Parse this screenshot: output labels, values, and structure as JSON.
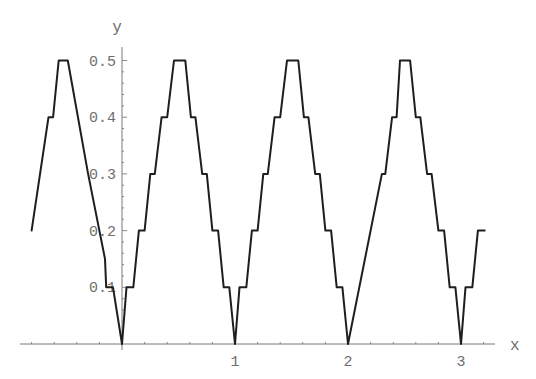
{
  "chart_data": {
    "type": "line",
    "title": "",
    "xlabel": "x",
    "ylabel": "y",
    "xlim": [
      -0.9,
      3.3
    ],
    "ylim": [
      0,
      0.52
    ],
    "grid": false,
    "legend": null,
    "x_ticks": [
      {
        "value": 1,
        "label": "1"
      },
      {
        "value": 2,
        "label": "2"
      },
      {
        "value": 3,
        "label": "3"
      }
    ],
    "x_minor_step": 0.2,
    "y_ticks": [
      {
        "value": 0.1,
        "label": "0.1"
      },
      {
        "value": 0.2,
        "label": "0.2"
      },
      {
        "value": 0.3,
        "label": "0.3"
      },
      {
        "value": 0.4,
        "label": "0.4"
      },
      {
        "value": 0.5,
        "label": "0.5"
      }
    ],
    "y_minor_step": 0.02,
    "series": [
      {
        "name": "y(x)",
        "color": "#1e1e1e",
        "points": [
          [
            -0.8,
            0.2
          ],
          [
            -0.65,
            0.4
          ],
          [
            -0.61,
            0.4
          ],
          [
            -0.56,
            0.5
          ],
          [
            -0.48,
            0.5
          ],
          [
            -0.3,
            0.3
          ],
          [
            -0.15,
            0.15
          ],
          [
            -0.14,
            0.1
          ],
          [
            -0.08,
            0.1
          ],
          [
            0.0,
            0.0
          ],
          [
            0.04,
            0.1
          ],
          [
            0.1,
            0.1
          ],
          [
            0.15,
            0.2
          ],
          [
            0.2,
            0.2
          ],
          [
            0.25,
            0.3
          ],
          [
            0.29,
            0.3
          ],
          [
            0.35,
            0.4
          ],
          [
            0.4,
            0.4
          ],
          [
            0.46,
            0.5
          ],
          [
            0.56,
            0.5
          ],
          [
            0.61,
            0.4
          ],
          [
            0.65,
            0.4
          ],
          [
            0.71,
            0.3
          ],
          [
            0.75,
            0.3
          ],
          [
            0.8,
            0.2
          ],
          [
            0.85,
            0.2
          ],
          [
            0.9,
            0.1
          ],
          [
            0.95,
            0.1
          ],
          [
            1.0,
            0.0
          ],
          [
            1.04,
            0.1
          ],
          [
            1.1,
            0.1
          ],
          [
            1.15,
            0.2
          ],
          [
            1.2,
            0.2
          ],
          [
            1.25,
            0.3
          ],
          [
            1.29,
            0.3
          ],
          [
            1.35,
            0.4
          ],
          [
            1.4,
            0.4
          ],
          [
            1.46,
            0.5
          ],
          [
            1.56,
            0.5
          ],
          [
            1.61,
            0.4
          ],
          [
            1.65,
            0.4
          ],
          [
            1.71,
            0.3
          ],
          [
            1.75,
            0.3
          ],
          [
            1.8,
            0.2
          ],
          [
            1.85,
            0.2
          ],
          [
            1.9,
            0.1
          ],
          [
            1.95,
            0.1
          ],
          [
            2.0,
            0.0
          ],
          [
            2.3,
            0.3
          ],
          [
            2.33,
            0.3
          ],
          [
            2.39,
            0.4
          ],
          [
            2.43,
            0.4
          ],
          [
            2.46,
            0.5
          ],
          [
            2.55,
            0.5
          ],
          [
            2.6,
            0.4
          ],
          [
            2.64,
            0.4
          ],
          [
            2.7,
            0.3
          ],
          [
            2.74,
            0.3
          ],
          [
            2.8,
            0.2
          ],
          [
            2.85,
            0.2
          ],
          [
            2.9,
            0.1
          ],
          [
            2.95,
            0.1
          ],
          [
            3.0,
            0.0
          ],
          [
            3.04,
            0.1
          ],
          [
            3.1,
            0.1
          ],
          [
            3.15,
            0.2
          ],
          [
            3.21,
            0.2
          ]
        ]
      }
    ]
  }
}
